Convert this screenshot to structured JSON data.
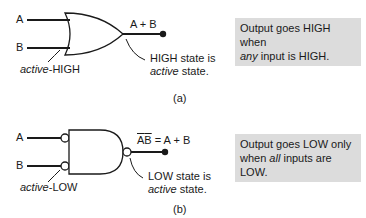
{
  "panel_a": {
    "input_a": "A",
    "input_b": "B",
    "output_label": "A + B",
    "input_note_italic": "active",
    "input_note_rest": "-HIGH",
    "output_note_line1": "HIGH state is",
    "output_note_line2_italic": "active",
    "output_note_line2_rest": " state.",
    "caption": "(a)",
    "box_line1": "Output goes HIGH when",
    "box_line2_italic": "any",
    "box_line2_rest": " input is HIGH."
  },
  "panel_b": {
    "input_a": "A",
    "input_b": "B",
    "output_label_a": "A",
    "output_label_b": "B",
    "output_label_rest": " = A + B",
    "input_note_italic": "active",
    "input_note_rest": "-LOW",
    "output_note_line1": "LOW state is",
    "output_note_line2_italic": "active",
    "output_note_line2_rest": " state.",
    "caption": "(b)",
    "box_line1": "Output goes LOW only",
    "box_line2_pre": "when ",
    "box_line2_italic": "all",
    "box_line2_rest": " inputs are LOW."
  },
  "colors": {
    "box_bg": "#dcdcdc",
    "line": "#1a1a1a"
  }
}
